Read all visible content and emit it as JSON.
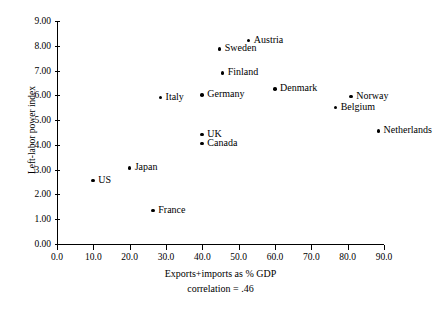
{
  "chart_data": {
    "type": "scatter",
    "title": "",
    "xlabel": "Exports+imports as % GDP",
    "ylabel": "Left-labor power index",
    "annotation": "correlation = .46",
    "xlim": [
      0.0,
      90.0
    ],
    "ylim": [
      0.0,
      9.0
    ],
    "grid": false,
    "legend": "none",
    "xticks": [
      "0.0",
      "10.0",
      "20.0",
      "30.0",
      "40.0",
      "50.0",
      "60.0",
      "70.0",
      "80.0",
      "90.0"
    ],
    "xtick_values": [
      0,
      10,
      20,
      30,
      40,
      50,
      60,
      70,
      80,
      90
    ],
    "yticks": [
      "0.00",
      "1.00",
      "2.00",
      "3.00",
      "4.00",
      "5.00",
      "6.00",
      "7.00",
      "8.00",
      "9.00"
    ],
    "ytick_values": [
      0,
      1,
      2,
      3,
      4,
      5,
      6,
      7,
      8,
      9
    ],
    "points": [
      {
        "label": "US",
        "x": 10.0,
        "y": 2.55
      },
      {
        "label": "Japan",
        "x": 20.0,
        "y": 3.05
      },
      {
        "label": "France",
        "x": 26.5,
        "y": 1.35
      },
      {
        "label": "Italy",
        "x": 28.5,
        "y": 5.9
      },
      {
        "label": "Canada",
        "x": 40.0,
        "y": 4.05
      },
      {
        "label": "UK",
        "x": 40.0,
        "y": 4.4
      },
      {
        "label": "Germany",
        "x": 40.0,
        "y": 6.0
      },
      {
        "label": "Sweden",
        "x": 44.8,
        "y": 7.85
      },
      {
        "label": "Finland",
        "x": 45.6,
        "y": 6.9
      },
      {
        "label": "Austria",
        "x": 52.8,
        "y": 8.2
      },
      {
        "label": "Denmark",
        "x": 60.0,
        "y": 6.25
      },
      {
        "label": "Belgium",
        "x": 76.7,
        "y": 5.5
      },
      {
        "label": "Norway",
        "x": 81.0,
        "y": 5.95
      },
      {
        "label": "Netherlands",
        "x": 88.5,
        "y": 4.55
      }
    ]
  },
  "colors": {
    "axis": "#000000",
    "marker": "#000000",
    "background": "#ffffff"
  }
}
